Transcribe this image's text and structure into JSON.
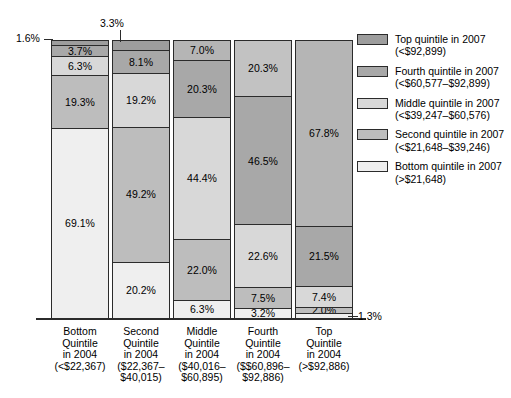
{
  "chart_data": {
    "type": "bar",
    "subtype": "stacked-bar-100pct",
    "title": "",
    "xlabel": "",
    "ylabel": "",
    "ylim": [
      0,
      100
    ],
    "grid": false,
    "legend_position": "right",
    "unit": "%",
    "categories": [
      "Bottom Quintile in 2004 (<$22,367)",
      "Second Quintile in 2004 ($22,367–$40,015)",
      "Middle Quintile in 2004 ($40,016–$60,895)",
      "Fourth Quintile in 2004 ($$60,896–$92,886)",
      "Top Quintile in 2004 (>$92,886)"
    ],
    "series": [
      {
        "name": "Top quintile in 2007 (<$92,899)",
        "color": "#9d9d9d",
        "values": [
          1.6,
          3.3,
          7.0,
          20.3,
          67.8
        ]
      },
      {
        "name": "Fourth quintile in 2007 (<$60,577–$92,899)",
        "color": "#a8a8a8",
        "values": [
          3.7,
          8.1,
          20.3,
          46.5,
          21.5
        ]
      },
      {
        "name": "Middle quintile in 2007 (<$39,247–$60,576)",
        "color": "#d8d8d8",
        "values": [
          6.3,
          19.2,
          44.4,
          22.6,
          7.4
        ]
      },
      {
        "name": "Second quintile in 2007 (<$21,648–$39,246)",
        "color": "#bdbdbd",
        "values": [
          19.3,
          49.2,
          22.0,
          7.5,
          2.0
        ]
      },
      {
        "name": "Bottom quintile in 2007 (>$21,648)",
        "color": "#efefef",
        "values": [
          69.1,
          20.2,
          6.3,
          3.2,
          1.3
        ]
      }
    ]
  },
  "bars": [
    {
      "name": "bottom-quintile-2004",
      "segments": [
        {
          "label": "1.6%",
          "value": 1.6,
          "color": "#9d9d9d",
          "inline": false
        },
        {
          "label": "3.7%",
          "value": 3.7,
          "color": "#a8a8a8",
          "inline": true
        },
        {
          "label": "6.3%",
          "value": 6.3,
          "color": "#d8d8d8",
          "inline": true
        },
        {
          "label": "19.3%",
          "value": 19.3,
          "color": "#bdbdbd",
          "inline": true
        },
        {
          "label": "69.1%",
          "value": 69.1,
          "color": "#efefef",
          "inline": true
        }
      ]
    },
    {
      "name": "second-quintile-2004",
      "segments": [
        {
          "label": "3.3%",
          "value": 3.3,
          "color": "#9d9d9d",
          "inline": false
        },
        {
          "label": "8.1%",
          "value": 8.1,
          "color": "#a8a8a8",
          "inline": true
        },
        {
          "label": "19.2%",
          "value": 19.2,
          "color": "#d8d8d8",
          "inline": true
        },
        {
          "label": "49.2%",
          "value": 49.2,
          "color": "#bdbdbd",
          "inline": true
        },
        {
          "label": "20.2%",
          "value": 20.2,
          "color": "#efefef",
          "inline": true
        }
      ]
    },
    {
      "name": "middle-quintile-2004",
      "segments": [
        {
          "label": "7.0%",
          "value": 7.0,
          "color": "#b5b5b5",
          "inline": true
        },
        {
          "label": "20.3%",
          "value": 20.3,
          "color": "#a8a8a8",
          "inline": true
        },
        {
          "label": "44.4%",
          "value": 44.4,
          "color": "#d8d8d8",
          "inline": true
        },
        {
          "label": "22.0%",
          "value": 22.0,
          "color": "#bdbdbd",
          "inline": true
        },
        {
          "label": "6.3%",
          "value": 6.3,
          "color": "#efefef",
          "inline": true
        }
      ]
    },
    {
      "name": "fourth-quintile-2004",
      "segments": [
        {
          "label": "20.3%",
          "value": 20.3,
          "color": "#c2c2c2",
          "inline": true
        },
        {
          "label": "46.5%",
          "value": 46.5,
          "color": "#a8a8a8",
          "inline": true
        },
        {
          "label": "22.6%",
          "value": 22.6,
          "color": "#d8d8d8",
          "inline": true
        },
        {
          "label": "7.5%",
          "value": 7.5,
          "color": "#bdbdbd",
          "inline": true
        },
        {
          "label": "3.2%",
          "value": 3.2,
          "color": "#efefef",
          "inline": true
        }
      ]
    },
    {
      "name": "top-quintile-2004",
      "segments": [
        {
          "label": "67.8%",
          "value": 67.8,
          "color": "#b5b5b5",
          "inline": true
        },
        {
          "label": "21.5%",
          "value": 21.5,
          "color": "#a8a8a8",
          "inline": true
        },
        {
          "label": "7.4%",
          "value": 7.4,
          "color": "#d8d8d8",
          "inline": true
        },
        {
          "label": "2.0%",
          "value": 2.0,
          "color": "#bdbdbd",
          "inline": true
        },
        {
          "label": "1.3%",
          "value": 1.3,
          "color": "#efefef",
          "inline": false
        }
      ]
    }
  ],
  "callouts": [
    {
      "name": "callout-1-6",
      "text": "1.6%"
    },
    {
      "name": "callout-3-3",
      "text": "3.3%"
    },
    {
      "name": "callout-1-3",
      "text": "1.3%"
    }
  ],
  "xaxis": {
    "labels": [
      {
        "l1": "Bottom",
        "l2": "Quintile",
        "l3": "in 2004",
        "l4": "(<$22,367)",
        "l5": ""
      },
      {
        "l1": "Second",
        "l2": "Quintile",
        "l3": "in 2004",
        "l4": "($22,367–",
        "l5": "$40,015)"
      },
      {
        "l1": "Middle",
        "l2": "Quintile",
        "l3": "in 2004",
        "l4": "($40,016–",
        "l5": "$60,895)"
      },
      {
        "l1": "Fourth",
        "l2": "Quintile",
        "l3": "in 2004",
        "l4": "($$60,896–",
        "l5": "$92,886)"
      },
      {
        "l1": "Top",
        "l2": "Quintile",
        "l3": "in 2004",
        "l4": "(>$92,886)",
        "l5": ""
      }
    ]
  },
  "legend": {
    "items": [
      {
        "name": "legend-top-quintile",
        "line1": "Top quintile in 2007",
        "line2": "(<$92,899)",
        "color": "#9d9d9d"
      },
      {
        "name": "legend-fourth-quintile",
        "line1": "Fourth quintile in 2007",
        "line2": "(<$60,577–$92,899)",
        "color": "#a8a8a8"
      },
      {
        "name": "legend-middle-quintile",
        "line1": "Middle quintile in 2007",
        "line2": "(<$39,247–$60,576)",
        "color": "#d8d8d8"
      },
      {
        "name": "legend-second-quintile",
        "line1": "Second quintile in 2007",
        "line2": "(<$21,648–$39,246)",
        "color": "#bdbdbd"
      },
      {
        "name": "legend-bottom-quintile",
        "line1": "Bottom quintile in 2007",
        "line2": "(>$21,648)",
        "color": "#efefef"
      }
    ]
  }
}
